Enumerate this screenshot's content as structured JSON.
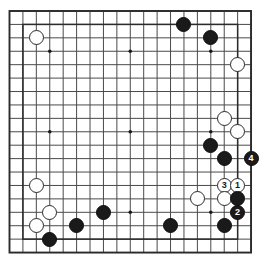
{
  "diagram": {
    "type": "go-board-diagram",
    "board_size": 19,
    "colors": {
      "background": "#ffffff",
      "grid_line": "#4a4a4a",
      "border_line": "#2b2b2b",
      "black_stone": "#1a1a1a",
      "white_stone": "#ffffff",
      "white_stone_edge": "#2a2a2a",
      "black_number_text": "#ffffff",
      "white_number_text": "#1a1a1a",
      "star_point": "#1a1a1a"
    },
    "geometry": {
      "origin_x": 9.5,
      "origin_y": 11.0,
      "cell": 13.42,
      "stone_diameter": 15,
      "star_point_radius": 1.8
    },
    "star_points": [
      {
        "col": 3,
        "row": 3
      },
      {
        "col": 9,
        "row": 3
      },
      {
        "col": 15,
        "row": 3
      },
      {
        "col": 3,
        "row": 9
      },
      {
        "col": 9,
        "row": 9
      },
      {
        "col": 15,
        "row": 9
      },
      {
        "col": 3,
        "row": 15
      },
      {
        "col": 9,
        "row": 15
      },
      {
        "col": 15,
        "row": 15
      }
    ],
    "move_numbers": [
      "1",
      "2",
      "3",
      "4"
    ],
    "stones": [
      {
        "col": 2,
        "row": 2,
        "color": "white",
        "label": "",
        "name": "white-stone-c17"
      },
      {
        "col": 13,
        "row": 1,
        "color": "black",
        "label": "",
        "name": "black-stone-n18"
      },
      {
        "col": 15,
        "row": 2,
        "color": "black",
        "label": "",
        "name": "black-stone-p17"
      },
      {
        "col": 17,
        "row": 4,
        "color": "white",
        "label": "",
        "name": "white-stone-r15"
      },
      {
        "col": 16,
        "row": 8,
        "color": "white",
        "label": "",
        "name": "white-stone-q11"
      },
      {
        "col": 17,
        "row": 9,
        "color": "white",
        "label": "",
        "name": "white-stone-r10"
      },
      {
        "col": 15,
        "row": 10,
        "color": "black",
        "label": "",
        "name": "black-stone-p9"
      },
      {
        "col": 16,
        "row": 11,
        "color": "black",
        "label": "",
        "name": "black-stone-q8"
      },
      {
        "col": 18,
        "row": 11,
        "color": "black",
        "label": "4",
        "name": "black-stone-move-4"
      },
      {
        "col": 16,
        "row": 13,
        "color": "white",
        "label": "3",
        "name": "white-stone-move-3"
      },
      {
        "col": 17,
        "row": 13,
        "color": "white",
        "label": "1",
        "name": "white-stone-move-1"
      },
      {
        "col": 2,
        "row": 13,
        "color": "white",
        "label": "",
        "name": "white-stone-c6"
      },
      {
        "col": 14,
        "row": 14,
        "color": "white",
        "label": "",
        "name": "white-stone-o5"
      },
      {
        "col": 16,
        "row": 14,
        "color": "white",
        "label": "",
        "name": "white-stone-q5"
      },
      {
        "col": 17,
        "row": 14,
        "color": "black",
        "label": "",
        "name": "black-stone-r5"
      },
      {
        "col": 3,
        "row": 15,
        "color": "white",
        "label": "",
        "name": "white-stone-d4"
      },
      {
        "col": 7,
        "row": 15,
        "color": "black",
        "label": "",
        "name": "black-stone-h4"
      },
      {
        "col": 17,
        "row": 15,
        "color": "black",
        "label": "2",
        "name": "black-stone-move-2"
      },
      {
        "col": 2,
        "row": 16,
        "color": "white",
        "label": "",
        "name": "white-stone-c3"
      },
      {
        "col": 5,
        "row": 16,
        "color": "black",
        "label": "",
        "name": "black-stone-f3"
      },
      {
        "col": 12,
        "row": 16,
        "color": "black",
        "label": "",
        "name": "black-stone-m3"
      },
      {
        "col": 16,
        "row": 16,
        "color": "black",
        "label": "",
        "name": "black-stone-q3"
      },
      {
        "col": 3,
        "row": 17,
        "color": "black",
        "label": "",
        "name": "black-stone-d2"
      }
    ]
  }
}
